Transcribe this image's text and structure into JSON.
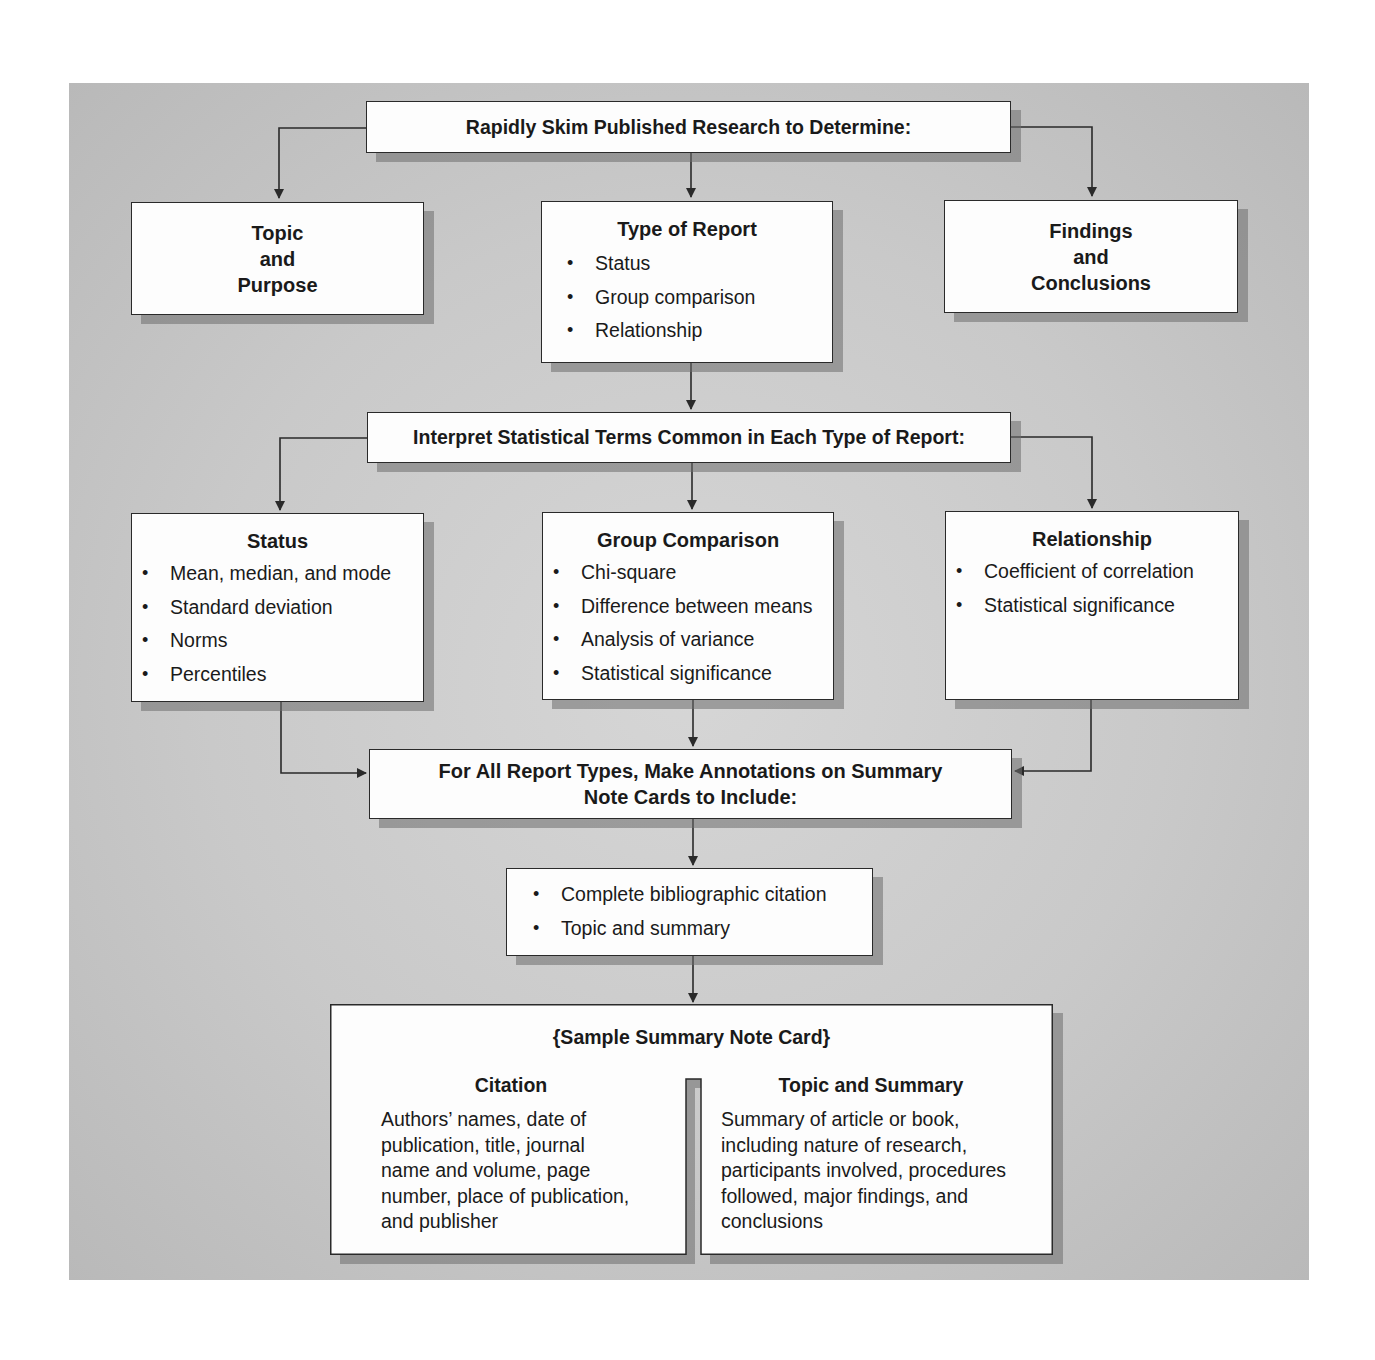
{
  "diagram": {
    "top": {
      "label": "Rapidly Skim Published Research to Determine:"
    },
    "level1": [
      {
        "title_lines": [
          "Topic",
          "and",
          "Purpose"
        ]
      },
      {
        "title": "Type of Report",
        "items": [
          "Status",
          "Group comparison",
          "Relationship"
        ]
      },
      {
        "title_lines": [
          "Findings",
          "and",
          "Conclusions"
        ]
      }
    ],
    "interpret": {
      "label": "Interpret Statistical Terms Common in Each Type of Report:"
    },
    "level2": [
      {
        "title": "Status",
        "items": [
          "Mean, median, and mode",
          "Standard deviation",
          "Norms",
          "Percentiles"
        ]
      },
      {
        "title": "Group Comparison",
        "items": [
          "Chi-square",
          "Difference between means",
          "Analysis of variance",
          "Statistical significance"
        ]
      },
      {
        "title": "Relationship",
        "items": [
          "Coefficient of correlation",
          "Statistical significance"
        ]
      }
    ],
    "annotate": {
      "lines": [
        "For All Report Types, Make Annotations on Summary",
        "Note Cards to Include:"
      ]
    },
    "include": {
      "items": [
        "Complete bibliographic citation",
        "Topic and summary"
      ]
    },
    "note_card": {
      "title": "{Sample Summary Note Card}",
      "citation": {
        "heading": "Citation",
        "lines": [
          "Authors’ names, date of",
          "publication, title, journal",
          "name and volume, page",
          "number, place of publication,",
          "and publisher"
        ]
      },
      "topic_summary": {
        "heading": "Topic and Summary",
        "lines": [
          "Summary of article or book,",
          "including nature of research,",
          "participants involved, procedures",
          "followed, major findings, and",
          "conclusions"
        ]
      }
    }
  },
  "colors": {
    "panel": "#c9c9c9",
    "box": "#fdfdfd",
    "line": "#2a2a2a",
    "shadow": "#8a8a8a"
  }
}
